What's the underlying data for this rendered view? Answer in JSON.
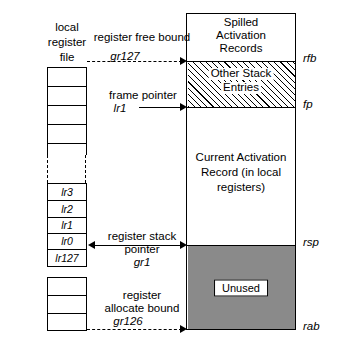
{
  "figure": {
    "left_column": {
      "heading_lines": [
        "local",
        "register",
        "file"
      ],
      "named_registers": [
        "lr3",
        "lr2",
        "lr1",
        "lr0",
        "lr127"
      ]
    },
    "memory_column": {
      "regions": [
        {
          "id": "spilled",
          "lines": [
            "Spilled",
            "Activation",
            "Records"
          ],
          "fill": "white"
        },
        {
          "id": "other-stack",
          "lines": [
            "Other Stack",
            "Entries"
          ],
          "fill": "hatched"
        },
        {
          "id": "current-activation",
          "lines": [
            "Current Activation",
            "Record (in local",
            "registers)"
          ],
          "fill": "white"
        },
        {
          "id": "unused",
          "lines": [
            "Unused"
          ],
          "fill": "gray"
        }
      ]
    },
    "boundary_labels": [
      {
        "id": "rfb",
        "text": "rfb"
      },
      {
        "id": "fp",
        "text": "fp"
      },
      {
        "id": "rsp",
        "text": "rsp"
      },
      {
        "id": "rab",
        "text": "rab"
      }
    ],
    "pointers": [
      {
        "id": "register-free-bound",
        "name_lines": [
          "register free bound"
        ],
        "register": "gr127",
        "arrow": "right",
        "line_style": "dashed"
      },
      {
        "id": "frame-pointer",
        "name_lines": [
          "frame pointer"
        ],
        "register": "lr1",
        "arrow": "right",
        "line_style": "solid"
      },
      {
        "id": "register-stack-pointer",
        "name_lines": [
          "register stack",
          "pointer"
        ],
        "register": "gr1",
        "arrow": "both",
        "line_style": "solid"
      },
      {
        "id": "register-allocate-bound",
        "name_lines": [
          "register",
          "allocate bound"
        ],
        "register": "gr126",
        "arrow": "right",
        "line_style": "dashed"
      }
    ],
    "colors": {
      "stroke": "#000000",
      "unused_fill": "#8a8a8a",
      "background": "#ffffff"
    }
  }
}
